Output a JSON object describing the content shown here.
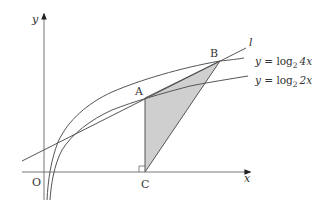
{
  "figure": {
    "axes": {
      "x_label": "x",
      "y_label": "y",
      "origin_label": "O"
    },
    "points": {
      "A": "A",
      "B": "B",
      "C": "C"
    },
    "line_label": "l",
    "curves": [
      {
        "name": "upper",
        "y_prefix": "y = ",
        "func": "log",
        "base": "2",
        "arg": "4x"
      },
      {
        "name": "lower",
        "y_prefix": "y = ",
        "func": "log",
        "base": "2",
        "arg": "2x"
      }
    ],
    "colors": {
      "stroke": "#555555",
      "fill": "#cfcfcf",
      "background": "#ffffff"
    },
    "shaded_region": "triangle ABC"
  }
}
